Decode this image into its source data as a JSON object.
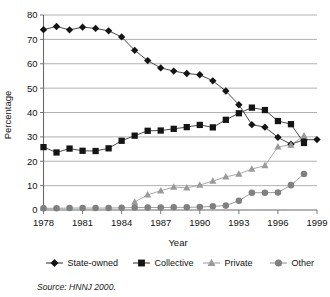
{
  "chart_data": {
    "type": "line",
    "title": "",
    "xlabel": "Year",
    "ylabel": "Percentage",
    "xlim": [
      1978,
      1999
    ],
    "ylim": [
      0,
      80
    ],
    "ytick_step": 10,
    "xtick_step": 3,
    "grid": "horizontal",
    "legend_position": "bottom",
    "xticklabels": [
      "1978",
      "1981",
      "1984",
      "1987",
      "1990",
      "1993",
      "1996",
      "1999"
    ],
    "xtickvalues": [
      1978,
      1981,
      1984,
      1987,
      1990,
      1993,
      1996,
      1999
    ],
    "yticklabels": [
      "0",
      "10",
      "20",
      "30",
      "40",
      "50",
      "60",
      "70",
      "80"
    ],
    "ytickvalues": [
      0,
      10,
      20,
      30,
      40,
      50,
      60,
      70,
      80
    ],
    "x": [
      1978,
      1979,
      1980,
      1981,
      1982,
      1983,
      1984,
      1985,
      1986,
      1987,
      1988,
      1989,
      1990,
      1991,
      1992,
      1993,
      1994,
      1995,
      1996,
      1997,
      1998,
      1999
    ],
    "series": [
      {
        "name": "State-owned",
        "marker": "diamond",
        "color": "#141414",
        "line_color": "#2b2b2b",
        "values": [
          74.0,
          75.3,
          73.9,
          75.0,
          74.5,
          73.5,
          71.0,
          65.5,
          61.3,
          58.3,
          57.0,
          56.0,
          55.5,
          53.0,
          48.8,
          43.2,
          35.0,
          34.0,
          29.8,
          27.0,
          28.8,
          28.9
        ]
      },
      {
        "name": "Collective",
        "marker": "square",
        "color": "#141414",
        "line_color": "#2b2b2b",
        "values": [
          25.8,
          23.6,
          25.2,
          24.3,
          24.2,
          25.3,
          28.4,
          30.5,
          32.5,
          32.6,
          33.3,
          34.0,
          34.9,
          33.9,
          37.0,
          39.7,
          42.0,
          41.0,
          36.5,
          35.2,
          27.5,
          null
        ]
      },
      {
        "name": "Private",
        "marker": "triangle",
        "color": "#9a9a9a",
        "line_color": "#9a9a9a",
        "values": [
          null,
          null,
          null,
          null,
          null,
          null,
          null,
          3.3,
          6.2,
          7.9,
          9.4,
          9.1,
          10.2,
          11.9,
          13.6,
          14.8,
          16.8,
          18.2,
          25.9,
          26.7,
          30.4,
          null
        ]
      },
      {
        "name": "Other",
        "marker": "circle",
        "color": "#808080",
        "line_color": "#8c8c8c",
        "values": [
          0.7,
          0.7,
          0.8,
          0.8,
          0.8,
          0.8,
          0.9,
          1.0,
          1.0,
          1.0,
          1.1,
          1.1,
          1.2,
          1.5,
          1.8,
          3.8,
          7.1,
          7.1,
          7.2,
          10.2,
          14.8,
          null
        ]
      }
    ],
    "source": "Source:  HNNJ 2000."
  },
  "legend": {
    "items": [
      {
        "label": "State-owned",
        "marker": "diamond-marker-icon"
      },
      {
        "label": "Collective",
        "marker": "square-marker-icon"
      },
      {
        "label": "Private",
        "marker": "triangle-marker-icon"
      },
      {
        "label": "Other",
        "marker": "circle-marker-icon"
      }
    ]
  }
}
